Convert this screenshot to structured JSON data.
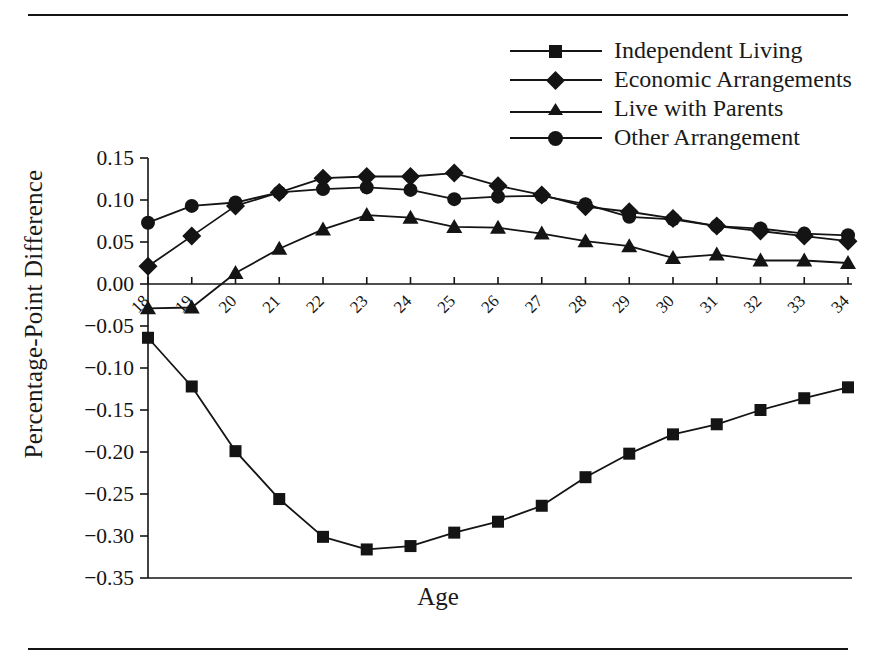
{
  "figure": {
    "xlabel": "Age",
    "ylabel": "Percentage-Point Difference",
    "line_color": "#141414",
    "marker_color": "#141414"
  },
  "legend": {
    "position": "top-right",
    "entries": [
      {
        "label": "Independent Living",
        "marker": "square-marker"
      },
      {
        "label": "Economic Arrangements",
        "marker": "diamond-marker"
      },
      {
        "label": "Live with Parents",
        "marker": "triangle-marker"
      },
      {
        "label": "Other Arrangement",
        "marker": "circle-marker"
      }
    ]
  },
  "chart_data": {
    "type": "line",
    "title": "",
    "xlabel": "Age",
    "ylabel": "Percentage-Point Difference",
    "x": [
      18,
      19,
      20,
      21,
      22,
      23,
      24,
      25,
      26,
      27,
      28,
      29,
      30,
      31,
      32,
      33,
      34
    ],
    "xlim": [
      18,
      34
    ],
    "ylim": [
      -0.35,
      0.15
    ],
    "yticks": [
      0.15,
      0.1,
      0.05,
      0.0,
      -0.05,
      -0.1,
      -0.15,
      -0.2,
      -0.25,
      -0.3,
      -0.35
    ],
    "ytick_labels": [
      "0.15",
      "0.10",
      "0.05",
      "0.00",
      "−0.05",
      "−0.10",
      "−0.15",
      "−0.20",
      "−0.25",
      "−0.30",
      "−0.35"
    ],
    "xtick_labels": [
      "18",
      "19",
      "20",
      "21",
      "22",
      "23",
      "24",
      "25",
      "26",
      "27",
      "28",
      "29",
      "30",
      "31",
      "32",
      "33",
      "34"
    ],
    "grid": false,
    "zero_line": true,
    "series": [
      {
        "name": "Independent Living",
        "marker": "square",
        "values": [
          -0.064,
          -0.122,
          -0.199,
          -0.256,
          -0.301,
          -0.316,
          -0.312,
          -0.296,
          -0.283,
          -0.264,
          -0.23,
          -0.202,
          -0.179,
          -0.167,
          -0.15,
          -0.136,
          -0.123
        ]
      },
      {
        "name": "Economic Arrangements",
        "marker": "diamond",
        "values": [
          0.021,
          0.057,
          0.093,
          0.109,
          0.126,
          0.128,
          0.128,
          0.132,
          0.117,
          0.106,
          0.092,
          0.086,
          0.078,
          0.069,
          0.063,
          0.057,
          0.051
        ]
      },
      {
        "name": "Live with Parents",
        "marker": "triangle",
        "values": [
          -0.029,
          -0.028,
          0.013,
          0.042,
          0.065,
          0.082,
          0.079,
          0.068,
          0.067,
          0.06,
          0.051,
          0.045,
          0.031,
          0.035,
          0.028,
          0.028,
          0.025
        ]
      },
      {
        "name": "Other Arrangement",
        "marker": "circle",
        "values": [
          0.073,
          0.093,
          0.097,
          0.109,
          0.113,
          0.115,
          0.112,
          0.101,
          0.104,
          0.105,
          0.095,
          0.08,
          0.077,
          0.069,
          0.066,
          0.06,
          0.058
        ]
      }
    ]
  }
}
